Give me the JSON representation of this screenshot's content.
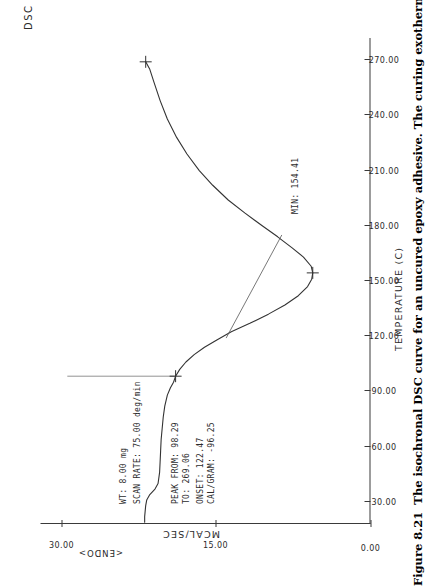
{
  "figure": {
    "number": "Figure 8.21",
    "caption": "The isochronal DSC curve for an uncured epoxy adhesive. The curing exothermic peak"
  },
  "instrument": {
    "mode_label": "DSC"
  },
  "parameters": [
    {
      "name": "wt",
      "text": "WT:   8.00 mg"
    },
    {
      "name": "scan-rate",
      "text": "SCAN RATE:   75.00 deg/min"
    },
    {
      "name": "peak-from",
      "text": "PEAK FROM: 98.29"
    },
    {
      "name": "peak-to",
      "text": "      TO: 269.06"
    },
    {
      "name": "onset",
      "text": "ONSET: 122.47"
    },
    {
      "name": "cal-gram",
      "text": "CAL/GRAM: -96.25"
    }
  ],
  "annotations": [
    {
      "name": "peak-min",
      "text": "MIN: 154.41"
    }
  ],
  "chart_data": {
    "type": "line",
    "title": "",
    "xlabel": "TEMPERATURE  (C)",
    "ylabel": "MCAL/SEC",
    "y_direction_label": "<ENDO>",
    "xlim": [
      18,
      282
    ],
    "ylim": [
      0,
      32
    ],
    "xticks": [
      30,
      60,
      90,
      120,
      150,
      180,
      210,
      240,
      270
    ],
    "xticklabels": [
      "30.00",
      "60.00",
      "90.00",
      "120.00",
      "150.00",
      "180.00",
      "210.00",
      "240.00",
      "270.00"
    ],
    "yticks": [
      0,
      15,
      30
    ],
    "yticklabels": [
      "0.00",
      "15.00",
      "30.00"
    ],
    "grid": false,
    "legend": false,
    "markers": {
      "peak_from_x": 98.29,
      "peak_to_x": 269.06,
      "onset_x": 122.47,
      "min_x": 154.41,
      "min_y": 5.6,
      "cal_per_gram": -96.25
    },
    "series": [
      {
        "name": "heat flow",
        "x": [
          19,
          22,
          25,
          28,
          31,
          34,
          37,
          40,
          46,
          52,
          58,
          64,
          70,
          76,
          82,
          88,
          92,
          95,
          98.29,
          102,
          106,
          110,
          114,
          118,
          122.47,
          127,
          132,
          137,
          142,
          147,
          151,
          154.41,
          158,
          163,
          168,
          174,
          180,
          187,
          194,
          202,
          210,
          219,
          228,
          238,
          248,
          258,
          265,
          269.06
        ],
        "y": [
          21.9,
          21.9,
          21.85,
          21.8,
          21.7,
          21.4,
          20.9,
          20.6,
          20.45,
          20.4,
          20.35,
          20.3,
          20.2,
          20.1,
          19.95,
          19.7,
          19.4,
          19.1,
          18.9,
          18.5,
          17.9,
          17.1,
          16.1,
          14.9,
          13.5,
          11.7,
          9.9,
          8.3,
          7.0,
          6.1,
          5.7,
          5.6,
          5.75,
          6.5,
          7.6,
          9.0,
          10.5,
          12.2,
          13.8,
          15.3,
          16.6,
          17.8,
          18.8,
          19.7,
          20.4,
          21.0,
          21.4,
          21.8
        ]
      }
    ],
    "baseline": {
      "name": "onset tangent baseline",
      "x": [
        119,
        175
      ],
      "y": [
        14.0,
        8.6
      ]
    },
    "peak_marker_line": {
      "x": [
        98.29,
        98.29
      ],
      "y": [
        18.9,
        29.4
      ]
    }
  }
}
